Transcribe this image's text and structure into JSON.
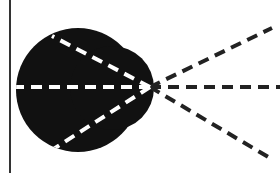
{
  "diagram": {
    "colors": {
      "background": "#ffffff",
      "blob": "#111111",
      "ray_inside": "#ffffff",
      "ray_outside": "#222222",
      "border": "#333333"
    },
    "border_line": {
      "x": 10,
      "y1": 0,
      "y2": 173
    },
    "blob": {
      "main_circle": {
        "cx": 78,
        "cy": 90,
        "r": 62
      },
      "side_circle": {
        "cx": 112,
        "cy": 88,
        "r": 42
      }
    },
    "focal_point": {
      "x": 150,
      "y": 87
    },
    "rays": [
      {
        "name": "upper",
        "x1": 52,
        "y1": 36,
        "x2": 272,
        "y2": 28
      },
      {
        "name": "middle",
        "x1": 22,
        "y1": 92,
        "x2": 280,
        "y2": 92
      },
      {
        "name": "lower",
        "x1": 52,
        "y1": 150,
        "x2": 270,
        "y2": 158
      }
    ]
  }
}
